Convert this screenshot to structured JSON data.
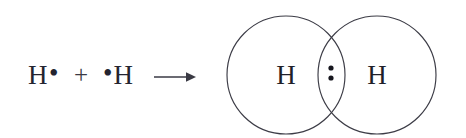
{
  "diagram": {
    "background_color": "#ffffff",
    "stroke_color": "#3c3c46",
    "text_color": "#1f1f29"
  },
  "equation": {
    "reactant_one": {
      "atom": "H",
      "electron_dot": "•",
      "dot_position": "right"
    },
    "operator": "+",
    "reactant_two": {
      "atom": "H",
      "electron_dot": "•",
      "dot_position": "left"
    },
    "arrow": {
      "icon": "right-arrow-icon",
      "glyph": "→"
    }
  },
  "product": {
    "label": "H2",
    "left_orbital": {
      "atom": "H",
      "center_x": 68,
      "center_y": 67,
      "radius": 59
    },
    "right_orbital": {
      "atom": "H",
      "center_x": 159,
      "center_y": 67,
      "radius": 59
    },
    "shared_electrons": {
      "count": 2,
      "positions": [
        {
          "cx": 113,
          "cy": 60,
          "r": 2.6
        },
        {
          "cx": 113,
          "cy": 70,
          "r": 2.6
        }
      ]
    }
  },
  "chart_data": {
    "type": "diagram",
    "notation": "Lewis electron-dot structure with overlapping orbital (Venn) representation",
    "equation_text": "H• + •H → H : H",
    "reactants": [
      {
        "species": "H",
        "unpaired_electrons": 1,
        "dot_side": "right"
      },
      {
        "species": "H",
        "unpaired_electrons": 1,
        "dot_side": "left"
      }
    ],
    "products": [
      {
        "species": "H2",
        "bond_type": "single covalent",
        "shared_electron_pair": 2,
        "atoms": [
          "H",
          "H"
        ],
        "representation": "two overlapping circles with a shared electron pair in the intersection"
      }
    ],
    "annotations": [
      "Each hydrogen atom contributes one electron",
      "The two dots in the overlap represent the shared bonding pair"
    ]
  }
}
